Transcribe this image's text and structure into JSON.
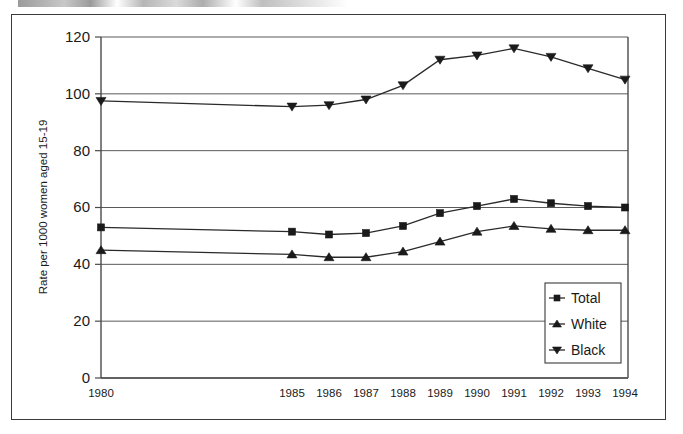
{
  "figure": {
    "ylabel": "Rate per 1000 women aged 15-19",
    "legend_title": ""
  },
  "legend": {
    "items": [
      {
        "label": "Total",
        "marker": "square-marker"
      },
      {
        "label": "White",
        "marker": "triangle-up-marker"
      },
      {
        "label": "Black",
        "marker": "triangle-down-marker"
      }
    ]
  },
  "axes": {
    "y_ticks": [
      "0",
      "20",
      "40",
      "60",
      "80",
      "100",
      "120"
    ],
    "x_ticks": [
      "1980",
      "1985",
      "1986",
      "1987",
      "1988",
      "1989",
      "1990",
      "1991",
      "1992",
      "1993",
      "1994"
    ]
  },
  "chart_data": {
    "type": "line",
    "title": "",
    "xlabel": "",
    "ylabel": "Rate per 1000 women aged 15-19",
    "categories": [
      "1980",
      "1985",
      "1986",
      "1987",
      "1988",
      "1989",
      "1990",
      "1991",
      "1992",
      "1993",
      "1994"
    ],
    "ylim": [
      0,
      120
    ],
    "ytick_step": 20,
    "grid": "horizontal",
    "legend_position": "lower-right",
    "series": [
      {
        "name": "Total",
        "marker": "square",
        "values": [
          53,
          51.5,
          50.5,
          51,
          53.5,
          58,
          60.5,
          63,
          61.5,
          60.5,
          60
        ]
      },
      {
        "name": "White",
        "marker": "triangle-up",
        "values": [
          45,
          43.5,
          42.5,
          42.5,
          44.5,
          48,
          51.5,
          53.5,
          52.5,
          52,
          52
        ]
      },
      {
        "name": "Black",
        "marker": "triangle-down",
        "values": [
          97.5,
          95.5,
          96,
          98,
          103,
          112,
          113.5,
          116,
          113,
          109,
          105
        ]
      }
    ]
  }
}
